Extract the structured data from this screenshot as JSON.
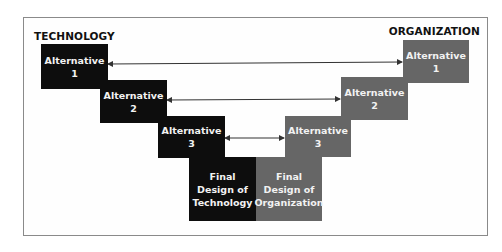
{
  "diagram": {
    "left_header": "TECHNOLOGY",
    "right_header": "ORGANIZATION",
    "technology_alternatives": [
      {
        "line1": "Alternative",
        "line2": "1"
      },
      {
        "line1": "Alternative",
        "line2": "2"
      },
      {
        "line1": "Alternative",
        "line2": "3"
      }
    ],
    "organization_alternatives": [
      {
        "line1": "Alternative",
        "line2": "1"
      },
      {
        "line1": "Alternative",
        "line2": "2"
      },
      {
        "line1": "Alternative",
        "line2": "3"
      }
    ],
    "final_technology": {
      "line1": "Final",
      "line2": "Design of",
      "line3": "Technology"
    },
    "final_organization": {
      "line1": "Final",
      "line2": "Design of",
      "line3": "Organization"
    },
    "colors": {
      "technology": "#0d0d0d",
      "organization": "#666666",
      "arrow": "#333333"
    }
  }
}
